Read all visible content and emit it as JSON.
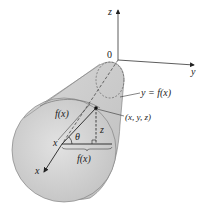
{
  "figure": {
    "type": "solid-of-revolution",
    "colors": {
      "solid_fill_light": "#e6e6e6",
      "solid_fill_dark": "#b9b9b9",
      "ink": "#222222",
      "background": "#ffffff"
    },
    "labels": {
      "z_axis": "z",
      "y_axis": "y",
      "x_axis": "x",
      "origin": "0",
      "curve": "y = f(x)",
      "point": "(x, y, z)",
      "radius_slant": "f(x)",
      "radius_horizontal": "f(x)",
      "height": "z",
      "angle": "θ",
      "x_position": "x"
    }
  }
}
